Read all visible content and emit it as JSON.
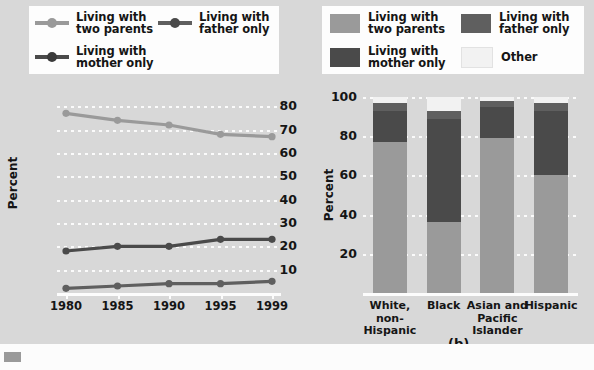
{
  "figure": {
    "background": "#d8d8d8",
    "panel_a_caption": "(a)",
    "panel_b_caption": "(b)"
  },
  "colors": {
    "two_parents": "#9a9a9a",
    "mother_only": "#4a4a4a",
    "father_only": "#5f5f5f",
    "other": "#f2f2f2",
    "grid": "#fbfbfb",
    "axis": "#fcfcfc",
    "text": "#151515"
  },
  "legend_a": {
    "items": [
      {
        "label": "Living with\ntwo parents",
        "line1": "Living with",
        "line2": "two parents",
        "color": "#9a9a9a",
        "icon": "line-marker-icon"
      },
      {
        "label": "Living with\nfather only",
        "line1": "Living with",
        "line2": "father only",
        "color": "#5f5f5f",
        "icon": "line-marker-icon"
      },
      {
        "label": "Living with\nmother only",
        "line1": "Living with",
        "line2": "mother only",
        "color": "#4a4a4a",
        "icon": "line-marker-icon"
      }
    ]
  },
  "legend_b": {
    "items": [
      {
        "line1": "Living with",
        "line2": "two parents",
        "color": "#9a9a9a",
        "icon": "swatch-icon"
      },
      {
        "line1": "Living with",
        "line2": "father only",
        "color": "#5f5f5f",
        "icon": "swatch-icon"
      },
      {
        "line1": "Living with",
        "line2": "mother only",
        "color": "#4a4a4a",
        "icon": "swatch-icon"
      },
      {
        "line1": "Other",
        "line2": "",
        "color": "#f2f2f2",
        "icon": "swatch-icon"
      }
    ]
  },
  "chart_data": [
    {
      "type": "line",
      "panel": "(a)",
      "title": "",
      "xlabel": "",
      "ylabel": "Percent",
      "x": [
        "1980",
        "1985",
        "1990",
        "1995",
        "1999"
      ],
      "xlim": [
        1980,
        1999
      ],
      "ylim": [
        0,
        84
      ],
      "yticks": [
        10,
        20,
        30,
        40,
        50,
        60,
        70,
        80
      ],
      "grid": true,
      "legend_position": "above-plot",
      "series": [
        {
          "name": "Living with two parents",
          "color": "#9a9a9a",
          "values": [
            77,
            74,
            72,
            68,
            67
          ]
        },
        {
          "name": "Living with mother only",
          "color": "#4a4a4a",
          "values": [
            18,
            20,
            20,
            23,
            23
          ]
        },
        {
          "name": "Living with father only",
          "color": "#5f5f5f",
          "values": [
            2,
            3,
            4,
            4,
            5
          ]
        }
      ]
    },
    {
      "type": "bar",
      "subtype": "stacked",
      "panel": "(b)",
      "title": "",
      "xlabel": "",
      "ylabel": "Percent",
      "categories": [
        "White,\nnon-Hispanic",
        "Black",
        "Asian and\nPacific\nIslander",
        "Hispanic"
      ],
      "category_lines": [
        [
          "White,",
          "non-Hispanic"
        ],
        [
          "Black"
        ],
        [
          "Asian and",
          "Pacific",
          "Islander"
        ],
        [
          "Hispanic"
        ]
      ],
      "ylim": [
        0,
        100
      ],
      "yticks": [
        20,
        40,
        60,
        80,
        100
      ],
      "grid": true,
      "legend_position": "above-plot",
      "series": [
        {
          "name": "Living with two parents",
          "color": "#9a9a9a",
          "values": [
            77,
            36,
            79,
            60
          ]
        },
        {
          "name": "Living with mother only",
          "color": "#4a4a4a",
          "values": [
            16,
            53,
            16,
            33
          ]
        },
        {
          "name": "Living with father only",
          "color": "#5f5f5f",
          "values": [
            4,
            4,
            3,
            4
          ]
        },
        {
          "name": "Other",
          "color": "#f2f2f2",
          "values": [
            3,
            7,
            2,
            3
          ]
        }
      ]
    }
  ]
}
